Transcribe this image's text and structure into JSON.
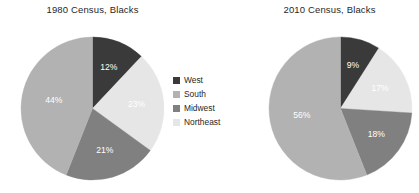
{
  "figure": {
    "background": "#ffffff"
  },
  "legend": {
    "position": "center-between-charts",
    "items": [
      {
        "label": "West",
        "color": "#3a3a3a",
        "swatch_name": "legend-swatch-west"
      },
      {
        "label": "South",
        "color": "#b2b2b2",
        "swatch_name": "legend-swatch-south"
      },
      {
        "label": "Midwest",
        "color": "#808080",
        "swatch_name": "legend-swatch-midwest"
      },
      {
        "label": "Northeast",
        "color": "#e6e6e6",
        "swatch_name": "legend-swatch-northeast"
      }
    ]
  },
  "chart_data": [
    {
      "type": "pie",
      "title": "1980 Census, Blacks",
      "categories": [
        "West",
        "Northeast",
        "Midwest",
        "South"
      ],
      "values": [
        12,
        23,
        21,
        44
      ],
      "labels": [
        "12%",
        "23%",
        "21%",
        "44%"
      ],
      "colors": [
        "#3a3a3a",
        "#e6e6e6",
        "#808080",
        "#b2b2b2"
      ],
      "start_angle_deg": 0,
      "direction": "clockwise",
      "units": "percent",
      "legend": [
        "West",
        "South",
        "Midwest",
        "Northeast"
      ],
      "xlabel": "",
      "ylabel": ""
    },
    {
      "type": "pie",
      "title": "2010 Census, Blacks",
      "categories": [
        "West",
        "Northeast",
        "Midwest",
        "South"
      ],
      "values": [
        9,
        17,
        18,
        56
      ],
      "labels": [
        "9%",
        "17%",
        "18%",
        "56%"
      ],
      "colors": [
        "#3a3a3a",
        "#e6e6e6",
        "#808080",
        "#b2b2b2"
      ],
      "start_angle_deg": 0,
      "direction": "clockwise",
      "units": "percent",
      "legend": [
        "West",
        "South",
        "Midwest",
        "Northeast"
      ],
      "xlabel": "",
      "ylabel": ""
    }
  ]
}
